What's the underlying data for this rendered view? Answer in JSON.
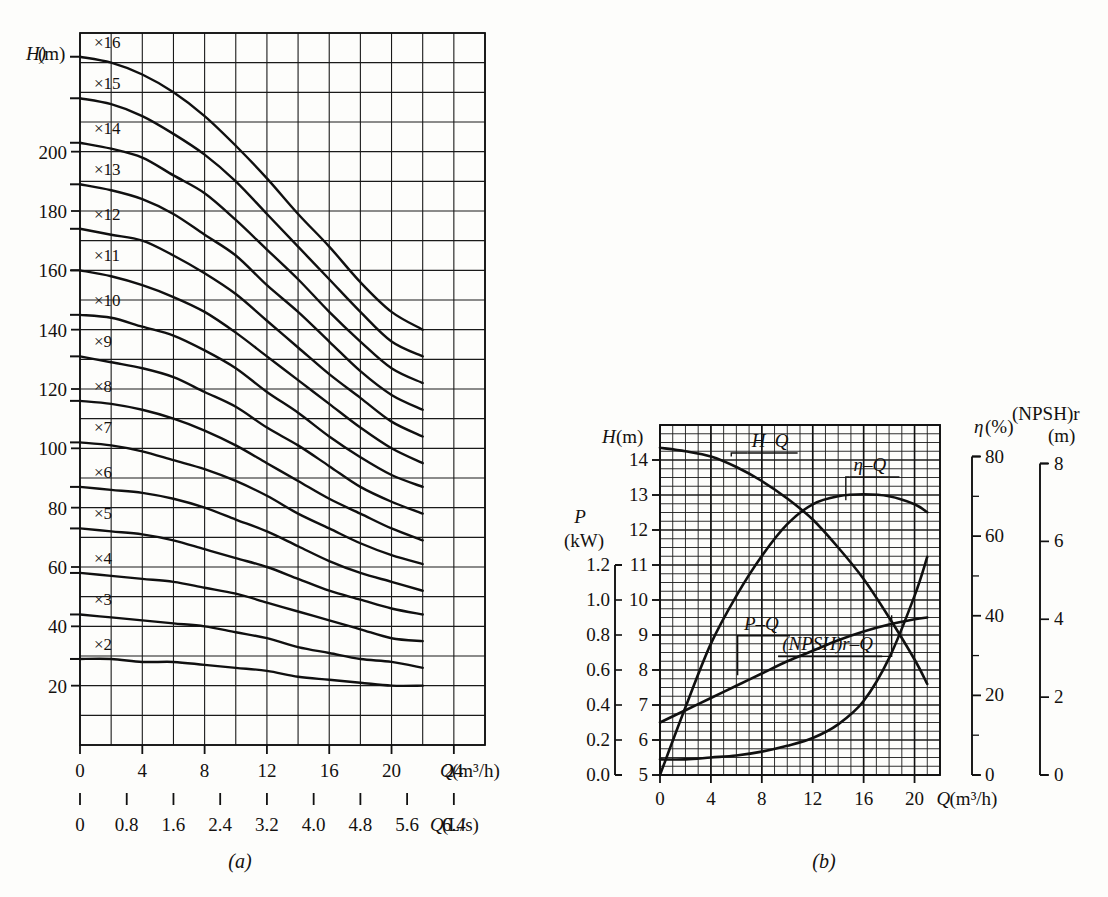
{
  "figure": {
    "caption_a": "(a)",
    "caption_b": "(b)"
  },
  "chart_data": [
    {
      "id": "chart-a",
      "type": "line",
      "title": "",
      "caption": "(a)",
      "xlabel": "Q(m³/h)",
      "xlabel_secondary": "Q(L/s)",
      "ylabel": "H(m)",
      "xlim": [
        0,
        26
      ],
      "ylim": [
        0,
        240
      ],
      "xticks": [
        0,
        4,
        8,
        12,
        16,
        20,
        24
      ],
      "xtick_labels": [
        "0",
        "4",
        "8",
        "12",
        "16",
        "20",
        "24"
      ],
      "xticks_secondary": [
        0,
        0.8,
        1.6,
        2.4,
        3.2,
        4.0,
        4.8,
        5.6,
        6.4
      ],
      "xtick_labels_secondary": [
        "0",
        "0.8",
        "1.6",
        "2.4",
        "3.2",
        "4.0",
        "4.8",
        "5.6",
        "6.4"
      ],
      "yticks": [
        20,
        40,
        60,
        80,
        100,
        120,
        140,
        160,
        180,
        200
      ],
      "ytick_labels": [
        "20",
        "40",
        "60",
        "80",
        "100",
        "120",
        "140",
        "160",
        "180",
        "200"
      ],
      "grid": true,
      "grid_x_minor_step": 2,
      "grid_y_minor_step": 10,
      "series_note": "Multistage pump H-Q family; each curve labelled by stage count",
      "series": [
        {
          "name": "×16",
          "stages": 16,
          "x": [
            0,
            2,
            4,
            6,
            8,
            10,
            12,
            14,
            16,
            18,
            20,
            22
          ],
          "values": [
            232,
            230,
            226,
            220,
            212,
            202,
            191,
            179,
            168,
            156,
            146,
            140
          ]
        },
        {
          "name": "×15",
          "stages": 15,
          "x": [
            0,
            2,
            4,
            6,
            8,
            10,
            12,
            14,
            16,
            18,
            20,
            22
          ],
          "values": [
            218,
            216,
            212,
            206,
            199,
            190,
            179,
            168,
            157,
            146,
            136,
            131
          ]
        },
        {
          "name": "×14",
          "stages": 14,
          "x": [
            0,
            2,
            4,
            6,
            8,
            10,
            12,
            14,
            16,
            18,
            20,
            22
          ],
          "values": [
            203,
            201,
            198,
            192,
            186,
            177,
            167,
            157,
            146,
            136,
            127,
            122
          ]
        },
        {
          "name": "×13",
          "stages": 13,
          "x": [
            0,
            2,
            4,
            6,
            8,
            10,
            12,
            14,
            16,
            18,
            20,
            22
          ],
          "values": [
            189,
            187,
            184,
            179,
            172,
            165,
            155,
            146,
            136,
            126,
            118,
            113
          ]
        },
        {
          "name": "×12",
          "stages": 12,
          "x": [
            0,
            2,
            4,
            6,
            8,
            10,
            12,
            14,
            16,
            18,
            20,
            22
          ],
          "values": [
            174,
            172,
            170,
            165,
            159,
            152,
            143,
            134,
            125,
            117,
            109,
            104
          ]
        },
        {
          "name": "×11",
          "stages": 11,
          "x": [
            0,
            2,
            4,
            6,
            8,
            10,
            12,
            14,
            16,
            18,
            20,
            22
          ],
          "values": [
            160,
            158,
            155,
            151,
            146,
            139,
            131,
            123,
            115,
            107,
            100,
            95
          ]
        },
        {
          "name": "×10",
          "stages": 10,
          "x": [
            0,
            2,
            4,
            6,
            8,
            10,
            12,
            14,
            16,
            18,
            20,
            22
          ],
          "values": [
            145,
            144,
            141,
            138,
            133,
            127,
            119,
            112,
            104,
            97,
            91,
            87
          ]
        },
        {
          "name": "×9",
          "stages": 9,
          "x": [
            0,
            2,
            4,
            6,
            8,
            10,
            12,
            14,
            16,
            18,
            20,
            22
          ],
          "values": [
            131,
            129,
            127,
            124,
            119,
            114,
            107,
            101,
            94,
            87,
            82,
            78
          ]
        },
        {
          "name": "×8",
          "stages": 8,
          "x": [
            0,
            2,
            4,
            6,
            8,
            10,
            12,
            14,
            16,
            18,
            20,
            22
          ],
          "values": [
            116,
            115,
            113,
            110,
            106,
            101,
            95,
            89,
            83,
            78,
            73,
            69
          ]
        },
        {
          "name": "×7",
          "stages": 7,
          "x": [
            0,
            2,
            4,
            6,
            8,
            10,
            12,
            14,
            16,
            18,
            20,
            22
          ],
          "values": [
            102,
            101,
            99,
            96,
            93,
            89,
            84,
            78,
            73,
            68,
            64,
            61
          ]
        },
        {
          "name": "×6",
          "stages": 6,
          "x": [
            0,
            2,
            4,
            6,
            8,
            10,
            12,
            14,
            16,
            18,
            20,
            22
          ],
          "values": [
            87,
            86,
            85,
            83,
            80,
            76,
            72,
            67,
            62,
            58,
            55,
            52
          ]
        },
        {
          "name": "×5",
          "stages": 5,
          "x": [
            0,
            2,
            4,
            6,
            8,
            10,
            12,
            14,
            16,
            18,
            20,
            22
          ],
          "values": [
            73,
            72,
            71,
            69,
            66,
            63,
            60,
            56,
            52,
            49,
            46,
            44
          ]
        },
        {
          "name": "×4",
          "stages": 4,
          "x": [
            0,
            2,
            4,
            6,
            8,
            10,
            12,
            14,
            16,
            18,
            20,
            22
          ],
          "values": [
            58,
            57,
            56,
            55,
            53,
            51,
            48,
            45,
            42,
            39,
            36,
            35
          ]
        },
        {
          "name": "×3",
          "stages": 3,
          "x": [
            0,
            2,
            4,
            6,
            8,
            10,
            12,
            14,
            16,
            18,
            20,
            22
          ],
          "values": [
            44,
            43,
            42,
            41,
            40,
            38,
            36,
            33,
            31,
            29,
            28,
            26
          ]
        },
        {
          "name": "×2",
          "stages": 2,
          "x": [
            0,
            2,
            4,
            6,
            8,
            10,
            12,
            14,
            16,
            18,
            20,
            22
          ],
          "values": [
            29,
            29,
            28,
            28,
            27,
            26,
            25,
            23,
            22,
            21,
            20,
            20
          ]
        }
      ]
    },
    {
      "id": "chart-b",
      "type": "line",
      "title": "",
      "caption": "(b)",
      "xlabel": "Q(m³/h)",
      "xlim": [
        0,
        22
      ],
      "xticks": [
        0,
        4,
        8,
        12,
        16,
        20
      ],
      "xtick_labels": [
        "0",
        "4",
        "8",
        "12",
        "16",
        "20"
      ],
      "grid": true,
      "grid_x_minor_step": 1,
      "axes": [
        {
          "name": "H",
          "label": "H(m)",
          "lim": [
            5,
            15
          ],
          "ticks": [
            5,
            6,
            7,
            8,
            9,
            10,
            11,
            12,
            13,
            14
          ],
          "tick_labels": [
            "5",
            "6",
            "7",
            "8",
            "9",
            "10",
            "11",
            "12",
            "13",
            "14"
          ],
          "side": "left"
        },
        {
          "name": "P",
          "label": "P\n(kW)",
          "label_line1": "P",
          "label_line2": "(kW)",
          "lim": [
            0.0,
            1.2
          ],
          "ticks": [
            0.0,
            0.2,
            0.4,
            0.6,
            0.8,
            1.0,
            1.2
          ],
          "tick_labels": [
            "0.0",
            "0.2",
            "0.4",
            "0.6",
            "0.8",
            "1.0",
            "1.2"
          ],
          "side": "left-outer"
        },
        {
          "name": "eta",
          "label": "η(%)",
          "lim": [
            0,
            80
          ],
          "ticks": [
            0,
            20,
            40,
            60,
            80
          ],
          "tick_labels": [
            "0",
            "20",
            "40",
            "60",
            "80"
          ],
          "side": "right"
        },
        {
          "name": "NPSHr",
          "label_line1": "(NPSH)r",
          "label_line2": "(m)",
          "lim": [
            0,
            8
          ],
          "ticks": [
            0,
            2,
            4,
            6,
            8
          ],
          "tick_labels": [
            "0",
            "2",
            "4",
            "6",
            "8"
          ],
          "side": "right-outer"
        }
      ],
      "series": [
        {
          "name": "H–Q",
          "axis": "H",
          "annotation": "H–Q",
          "x": [
            0,
            2,
            4,
            6,
            8,
            10,
            12,
            14,
            16,
            18,
            20,
            21
          ],
          "values": [
            14.35,
            14.25,
            14.1,
            13.8,
            13.4,
            12.9,
            12.3,
            11.5,
            10.6,
            9.5,
            8.3,
            7.6
          ]
        },
        {
          "name": "P–Q",
          "axis": "P",
          "annotation": "P–Q",
          "x": [
            0,
            2,
            4,
            6,
            8,
            10,
            12,
            14,
            16,
            18,
            20,
            21
          ],
          "values": [
            0.3,
            0.37,
            0.44,
            0.51,
            0.58,
            0.65,
            0.71,
            0.77,
            0.82,
            0.86,
            0.89,
            0.9
          ]
        },
        {
          "name": "η–Q",
          "axis": "eta",
          "annotation": "η–Q",
          "x": [
            0,
            2,
            4,
            6,
            8,
            10,
            12,
            14,
            16,
            18,
            20,
            21
          ],
          "values": [
            0,
            17,
            33,
            45,
            55,
            63,
            68,
            70,
            70.5,
            70,
            68,
            66
          ]
        },
        {
          "name": "(NPSH)r–Q",
          "axis": "NPSHr",
          "annotation": "(NPSH)r–Q",
          "x": [
            0,
            2,
            4,
            6,
            8,
            10,
            12,
            14,
            16,
            18,
            20,
            21
          ],
          "values": [
            0.4,
            0.4,
            0.45,
            0.5,
            0.6,
            0.75,
            0.95,
            1.3,
            1.9,
            3.0,
            4.6,
            5.6
          ]
        }
      ],
      "annotations": [
        {
          "text": "H–Q",
          "for": "H-Q curve"
        },
        {
          "text": "η–Q",
          "for": "eta-Q curve"
        },
        {
          "text": "P–Q",
          "for": "P-Q curve"
        },
        {
          "text": "(NPSH)r–Q",
          "for": "NPSHr-Q curve"
        }
      ]
    }
  ]
}
